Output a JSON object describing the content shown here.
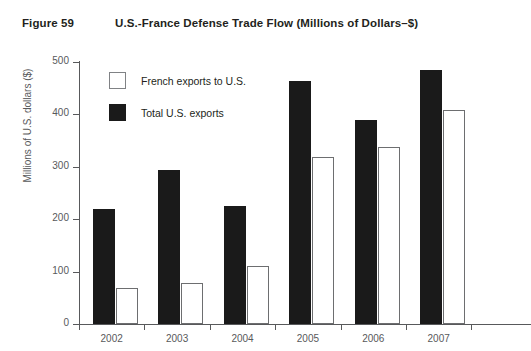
{
  "figure": {
    "number": "Figure 59",
    "title": "U.S.-France Defense Trade Flow (Millions of Dollars–$)"
  },
  "chart_data": {
    "type": "bar",
    "title": "U.S.-France Defense Trade Flow (Millions of Dollars–$)",
    "xlabel": "",
    "ylabel": "Millions of U.S. dollars ($)",
    "categories": [
      "2002",
      "2003",
      "2004",
      "2005",
      "2006",
      "2007"
    ],
    "series": [
      {
        "name": "Total U.S. exports",
        "color": "#1a1a1a",
        "style": "filled",
        "values": [
          219,
          294,
          225,
          464,
          390,
          485
        ]
      },
      {
        "name": "French exports to U.S.",
        "color": "#ffffff",
        "style": "outlined",
        "values": [
          69,
          79,
          111,
          319,
          338,
          409
        ]
      }
    ],
    "ylim": [
      0,
      500
    ],
    "yticks": [
      0,
      100,
      200,
      300,
      400,
      500
    ],
    "ytick_labels": [
      "0",
      "100",
      "200",
      "300",
      "400",
      "500"
    ],
    "grid": false,
    "legend_position": "upper-left-inside",
    "legend_order": [
      "French exports to U.S.",
      "Total U.S. exports"
    ]
  },
  "legend": [
    {
      "label": "French exports to U.S.",
      "swatch": "white"
    },
    {
      "label": "Total U.S. exports",
      "swatch": "black"
    }
  ]
}
